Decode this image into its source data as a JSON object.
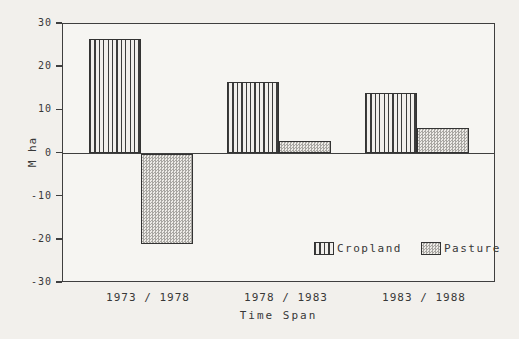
{
  "figure": {
    "background": "#f2f0ec",
    "plot_background": "#f6f5f2",
    "line_color": "#3f3f3f",
    "text_color": "#383838"
  },
  "chart_data": {
    "type": "bar",
    "title": "",
    "categories": [
      "1973 / 1978",
      "1978 / 1983",
      "1983 / 1988"
    ],
    "series": [
      {
        "name": "Cropland",
        "pattern": "vertical-stripes",
        "values": [
          26.5,
          16.5,
          14
        ]
      },
      {
        "name": "Pasture",
        "pattern": "dot-checker",
        "values": [
          -21,
          3,
          6
        ]
      }
    ],
    "xlabel": "Time Span",
    "ylabel": "M ha",
    "ylim": [
      -30,
      30
    ],
    "yticks": [
      30,
      20,
      10,
      0,
      -10,
      -20,
      -30
    ],
    "grid": false,
    "legend": {
      "position": "inside-bottom-right",
      "entries": [
        "Cropland",
        "Pasture"
      ]
    }
  }
}
